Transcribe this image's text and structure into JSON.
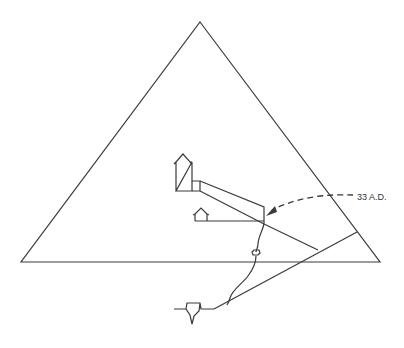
{
  "diagram": {
    "annotation": {
      "label": "33 A.D."
    },
    "colors": {
      "line": "#3a3a3a",
      "background": "#ffffff"
    },
    "elements": [
      "pyramid-outline",
      "ground-line",
      "kings-chamber",
      "antechamber",
      "grand-gallery",
      "queens-chamber",
      "horizontal-passage",
      "ascending-passage",
      "descending-passage",
      "well-shaft",
      "grotto",
      "subterranean-chamber",
      "date-arrow"
    ]
  }
}
